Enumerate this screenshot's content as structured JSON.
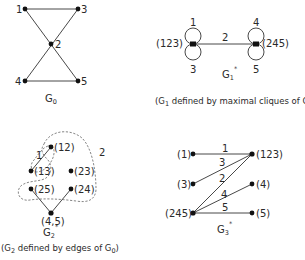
{
  "panels": {
    "g0": {
      "title": "G",
      "title_sub": "0",
      "nodes": [
        {
          "id": "1",
          "label": "1"
        },
        {
          "id": "3",
          "label": "3"
        },
        {
          "id": "2",
          "label": "2"
        },
        {
          "id": "4",
          "label": "4"
        },
        {
          "id": "5",
          "label": "5"
        }
      ],
      "edges": [
        [
          "1",
          "3"
        ],
        [
          "1",
          "5"
        ],
        [
          "3",
          "4"
        ],
        [
          "4",
          "5"
        ]
      ]
    },
    "g1": {
      "title": "G",
      "title_sub": "1",
      "title_sup": "*",
      "caption_pre": "(G",
      "caption_sub": "1",
      "caption_mid": " defined by maximal cliques of G",
      "caption_sub2": "0",
      "caption_post": ")",
      "nodes": [
        {
          "id": "123",
          "label": "(123)"
        },
        {
          "id": "245",
          "label": "(245)"
        }
      ],
      "edge_label": "2",
      "loops": {
        "left_top": "1",
        "left_bottom": "3",
        "right_top": "4",
        "right_bottom": "5"
      }
    },
    "g2": {
      "title": "G",
      "title_sub": "2",
      "title_sup": "*",
      "caption_pre": "(G",
      "caption_sub": "2",
      "caption_mid": " defined  by edges of G",
      "caption_sub2": "0",
      "caption_post": ")",
      "nodes": [
        {
          "id": "12",
          "label": "(12)"
        },
        {
          "id": "13",
          "label": "(13)"
        },
        {
          "id": "23",
          "label": "(23)"
        },
        {
          "id": "25",
          "label": "(25)"
        },
        {
          "id": "24",
          "label": "(24)"
        },
        {
          "id": "45",
          "label": "(4,5)"
        }
      ],
      "region_labels": {
        "r1": "1",
        "r2": "2"
      }
    },
    "g3": {
      "title": "G",
      "title_sub": "3",
      "title_sup": "*",
      "nodes": [
        {
          "id": "1",
          "label": "(1)"
        },
        {
          "id": "3",
          "label": "(3)"
        },
        {
          "id": "245",
          "label": "(245)"
        },
        {
          "id": "123",
          "label": "(123)"
        },
        {
          "id": "4",
          "label": "(4)"
        },
        {
          "id": "5",
          "label": "(5)"
        }
      ],
      "edge_labels": {
        "e1": "1",
        "e3": "3",
        "e2": "2",
        "e4": "4",
        "e5": "5"
      }
    }
  }
}
